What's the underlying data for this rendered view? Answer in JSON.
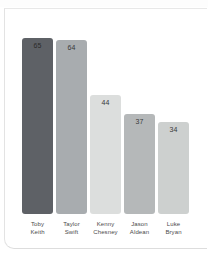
{
  "chart_data": {
    "type": "bar",
    "title": "",
    "subtitle": "",
    "xlabel": "",
    "ylabel": "",
    "ylim": [
      0,
      70
    ],
    "grid": false,
    "legend": "none",
    "categories": [
      "Toby Keith",
      "Taylor Swift",
      "Kenny Chesney",
      "Jason Aldean",
      "Luke Bryan"
    ],
    "values": [
      65,
      64,
      44,
      37,
      34
    ],
    "bars": [
      {
        "label_line1": "Toby",
        "label_line2": "Keith",
        "value": 65,
        "value_text": "65",
        "color": "#5e6166"
      },
      {
        "label_line1": "Taylor",
        "label_line2": "Swift",
        "value": 64,
        "value_text": "64",
        "color": "#a8acaf"
      },
      {
        "label_line1": "Kenny",
        "label_line2": "Chesney",
        "value": 44,
        "value_text": "44",
        "color": "#dcdedd"
      },
      {
        "label_line1": "Jason",
        "label_line2": "Aldean",
        "value": 37,
        "value_text": "37",
        "color": "#b5b8b9"
      },
      {
        "label_line1": "Luke",
        "label_line2": "Bryan",
        "value": 34,
        "value_text": "34",
        "color": "#cdd0cf"
      }
    ]
  },
  "colors": {
    "card_background": "#ffffff",
    "page_background": "#ffffff",
    "card_border": "#e3e3e3",
    "value_text": "#3a3a3a",
    "label_text": "#4a4a4a"
  }
}
